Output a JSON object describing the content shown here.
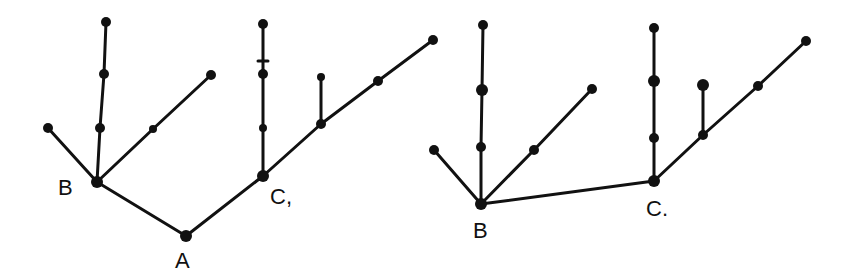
{
  "diagram": {
    "type": "tree-graphs",
    "colors": {
      "ink": "#111111",
      "background": "#ffffff"
    },
    "trees": [
      {
        "id": "left",
        "labels": [
          {
            "id": "B",
            "text": "B",
            "x": 58,
            "y": 195
          },
          {
            "id": "A",
            "text": "A",
            "x": 175,
            "y": 268
          },
          {
            "id": "C",
            "text": "C,",
            "x": 270,
            "y": 204
          }
        ],
        "nodes": [
          {
            "id": "A",
            "x": 186,
            "y": 236,
            "r": 6
          },
          {
            "id": "B",
            "x": 97,
            "y": 182,
            "r": 6
          },
          {
            "id": "C",
            "x": 263,
            "y": 176,
            "r": 6
          },
          {
            "id": "b_leaf_left",
            "x": 48,
            "y": 128,
            "r": 5
          },
          {
            "id": "b_v1",
            "x": 100,
            "y": 128,
            "r": 5
          },
          {
            "id": "b_v2",
            "x": 104,
            "y": 74,
            "r": 5
          },
          {
            "id": "b_v3",
            "x": 106,
            "y": 22,
            "r": 5
          },
          {
            "id": "b_d1",
            "x": 153,
            "y": 129,
            "r": 4
          },
          {
            "id": "b_d2",
            "x": 211,
            "y": 75,
            "r": 5
          },
          {
            "id": "c_v1",
            "x": 263,
            "y": 128,
            "r": 4
          },
          {
            "id": "c_v2",
            "x": 263,
            "y": 74,
            "r": 5
          },
          {
            "id": "c_v3",
            "x": 263,
            "y": 24,
            "r": 5
          },
          {
            "id": "c_d1",
            "x": 321,
            "y": 124,
            "r": 5
          },
          {
            "id": "c_d1_up",
            "x": 321,
            "y": 77,
            "r": 4
          },
          {
            "id": "c_d2",
            "x": 378,
            "y": 81,
            "r": 5
          },
          {
            "id": "c_d3",
            "x": 433,
            "y": 40,
            "r": 5
          }
        ],
        "edges": [
          [
            "A",
            "B"
          ],
          [
            "A",
            "C"
          ],
          [
            "B",
            "b_leaf_left"
          ],
          [
            "B",
            "b_v1"
          ],
          [
            "b_v1",
            "b_v2"
          ],
          [
            "b_v2",
            "b_v3"
          ],
          [
            "B",
            "b_d1"
          ],
          [
            "b_d1",
            "b_d2"
          ],
          [
            "C",
            "c_v1"
          ],
          [
            "c_v1",
            "c_v2"
          ],
          [
            "c_v2",
            "c_v3"
          ],
          [
            "C",
            "c_d1"
          ],
          [
            "c_d1",
            "c_d1_up"
          ],
          [
            "c_d1",
            "c_d2"
          ],
          [
            "c_d2",
            "c_d3"
          ]
        ],
        "tick_marks": [
          {
            "x": 263,
            "y": 61,
            "half_width": 5
          }
        ]
      },
      {
        "id": "right",
        "labels": [
          {
            "id": "B",
            "text": "B",
            "x": 473,
            "y": 238
          },
          {
            "id": "C",
            "text": "C.",
            "x": 646,
            "y": 216
          }
        ],
        "nodes": [
          {
            "id": "B",
            "x": 481,
            "y": 204,
            "r": 6
          },
          {
            "id": "C",
            "x": 654,
            "y": 181,
            "r": 6
          },
          {
            "id": "b_leaf_left",
            "x": 434,
            "y": 150,
            "r": 5
          },
          {
            "id": "b_v1",
            "x": 481,
            "y": 147,
            "r": 5
          },
          {
            "id": "b_v2",
            "x": 482,
            "y": 90,
            "r": 6
          },
          {
            "id": "b_v3",
            "x": 483,
            "y": 25,
            "r": 5
          },
          {
            "id": "b_d1",
            "x": 534,
            "y": 150,
            "r": 5
          },
          {
            "id": "b_d2",
            "x": 592,
            "y": 89,
            "r": 5
          },
          {
            "id": "c_v1",
            "x": 654,
            "y": 138,
            "r": 5
          },
          {
            "id": "c_v2",
            "x": 654,
            "y": 81,
            "r": 6
          },
          {
            "id": "c_v3",
            "x": 654,
            "y": 28,
            "r": 5
          },
          {
            "id": "c_d1",
            "x": 703,
            "y": 135,
            "r": 5
          },
          {
            "id": "c_d1_up",
            "x": 703,
            "y": 85,
            "r": 6
          },
          {
            "id": "c_d2",
            "x": 758,
            "y": 86,
            "r": 5
          },
          {
            "id": "c_d3",
            "x": 806,
            "y": 41,
            "r": 5
          }
        ],
        "edges": [
          [
            "B",
            "C"
          ],
          [
            "B",
            "b_leaf_left"
          ],
          [
            "B",
            "b_v1"
          ],
          [
            "b_v1",
            "b_v2"
          ],
          [
            "b_v2",
            "b_v3"
          ],
          [
            "B",
            "b_d1"
          ],
          [
            "b_d1",
            "b_d2"
          ],
          [
            "C",
            "c_v1"
          ],
          [
            "c_v1",
            "c_v2"
          ],
          [
            "c_v2",
            "c_v3"
          ],
          [
            "C",
            "c_d1"
          ],
          [
            "c_d1",
            "c_d1_up"
          ],
          [
            "c_d1",
            "c_d2"
          ],
          [
            "c_d2",
            "c_d3"
          ]
        ],
        "tick_marks": []
      }
    ]
  }
}
